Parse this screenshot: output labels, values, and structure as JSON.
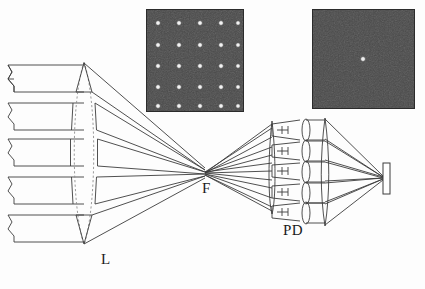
{
  "figure": {
    "type": "optical-system-diagram",
    "background": "#fdfdfd",
    "line_color": "#3c3c3c",
    "dashed_color": "#8a8a8a",
    "width": 425,
    "height": 289
  },
  "labels": {
    "lens": "L",
    "focus": "F",
    "photodetector": "PD"
  },
  "photos": {
    "left": {
      "caption": "",
      "grid_rows": 5,
      "grid_cols": 5,
      "background": "#3a3a3a",
      "dot_color": "#f2f2f2",
      "border": "#2b2b2b",
      "x": 146,
      "y": 9,
      "w": 98,
      "h": 103
    },
    "right": {
      "caption": "",
      "spots": 1,
      "background": "#3a3a3a",
      "dot_color": "#f2f2f2",
      "border": "#2b2b2b",
      "x": 312,
      "y": 9,
      "w": 103,
      "h": 100
    }
  },
  "beams": {
    "count": 5,
    "break_symbol": "zigzag-chevron",
    "y_centers": [
      78,
      116,
      152,
      190,
      228
    ]
  },
  "components": {
    "objective_lens": {
      "name": "L",
      "cx": 84,
      "cy": 152,
      "half_h": 90,
      "bulge": 13
    },
    "focal_point": {
      "name": "F",
      "x": 205,
      "y": 176
    },
    "pd_array": {
      "name": "PD",
      "channels": 5,
      "x": 272
    },
    "microlens_array": {
      "channels": 5,
      "x": 308
    },
    "field_lens": {
      "x": 325
    },
    "screen": {
      "x": 383,
      "y": 163,
      "w": 7,
      "h": 30
    }
  }
}
